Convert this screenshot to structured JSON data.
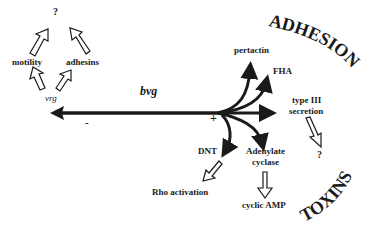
{
  "diagram": {
    "regulators": {
      "bvg": "bvg",
      "vrg": "vrg",
      "minus": "-",
      "plus": "+"
    },
    "vrg_branch": {
      "motility": "motility",
      "adhesins": "adhesins",
      "unknown": "?"
    },
    "adhesion_group": {
      "title": "ADHESION",
      "items": [
        "pertactin",
        "FHA"
      ]
    },
    "type3": {
      "line1": "type III",
      "line2": "secretion",
      "unknown": "?"
    },
    "toxins_group": {
      "title": "TOXINS",
      "dnt": "DNT",
      "dnt_effect": "Rho activation",
      "ac_line1": "Adenylate",
      "ac_line2": "cyclase",
      "ac_effect": "cyclic AMP"
    }
  }
}
